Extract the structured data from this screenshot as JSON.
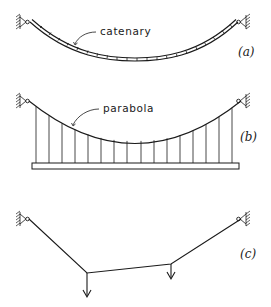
{
  "figure": {
    "panels": [
      {
        "id": "a",
        "label": "(a)",
        "callout": "catenary",
        "description": "Chain hanging under its own weight between two pinned supports"
      },
      {
        "id": "b",
        "label": "(b)",
        "callout": "parabola",
        "description": "Suspension cable carrying a uniformly loaded deck via equally spaced vertical hangers",
        "hanger_count": 16
      },
      {
        "id": "c",
        "label": "(c)",
        "callout": "",
        "description": "Cable between two pinned supports under two concentrated downward point loads",
        "point_loads": 2
      }
    ]
  }
}
